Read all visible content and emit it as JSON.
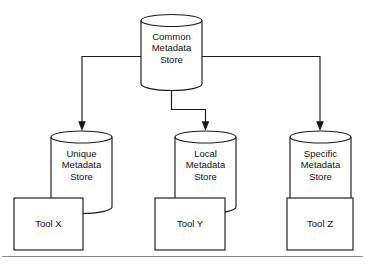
{
  "diagram": {
    "type": "block-diagram",
    "background_color": "#ffffff",
    "stroke_color": "#1a1a1a",
    "separator_color": "#8d8d8d",
    "nodes": {
      "common": {
        "shape": "cylinder",
        "line1": "Common",
        "line2": "Metadata",
        "line3": "Store"
      },
      "unique": {
        "shape": "cylinder",
        "line1": "Unique",
        "line2": "Metadata",
        "line3": "Store"
      },
      "local": {
        "shape": "cylinder",
        "line1": "Local",
        "line2": "Metadata",
        "line3": "Store"
      },
      "specific": {
        "shape": "cylinder",
        "line1": "Specific",
        "line2": "Metadata",
        "line3": "Store"
      },
      "tool_x": {
        "shape": "rectangle",
        "label": "Tool X"
      },
      "tool_y": {
        "shape": "rectangle",
        "label": "Tool Y"
      },
      "tool_z": {
        "shape": "rectangle",
        "label": "Tool Z"
      }
    },
    "connectors": [
      {
        "from": "common",
        "to": "unique",
        "style": "elbow-left-down",
        "arrow": "to"
      },
      {
        "from": "common",
        "to": "local",
        "style": "elbow-down-right-down",
        "arrow": "to"
      },
      {
        "from": "common",
        "to": "specific",
        "style": "elbow-right-down",
        "arrow": "to"
      }
    ],
    "separator": {
      "present": true,
      "orientation": "horizontal"
    }
  }
}
